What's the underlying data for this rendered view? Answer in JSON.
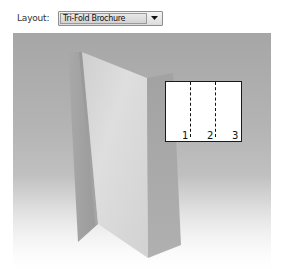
{
  "layout": {
    "label": "Layout:",
    "selected": "Tri-Fold Brochure",
    "arrow_icon": "chevron-down-icon"
  },
  "preview": {
    "description": "3D tri-fold brochure preview",
    "colors": {
      "background_top": "#a6a6a6",
      "background_bottom": "#ffffff",
      "left_panel": "#9d9d9d",
      "middle_panel": "#d9d9d9",
      "right_panel": "#a9a9a9"
    },
    "inset": {
      "panels": [
        "1",
        "2",
        "3"
      ]
    }
  }
}
